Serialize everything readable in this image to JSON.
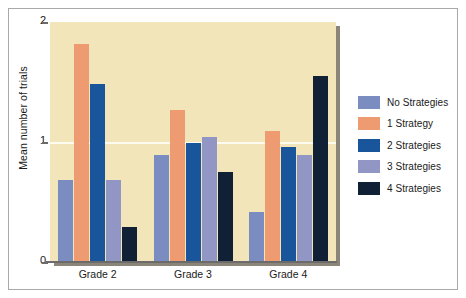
{
  "chart_data": {
    "type": "bar",
    "title": "",
    "xlabel": "",
    "ylabel": "Mean number of trials",
    "categories": [
      "Grade 2",
      "Grade 3",
      "Grade 4"
    ],
    "ylim": [
      0,
      2
    ],
    "yticks": [
      "0",
      "1",
      "2"
    ],
    "ytick_values": [
      0,
      1,
      2
    ],
    "grid": "horizontal gridline at y=1",
    "legend_position": "right",
    "plot_background": "#f2e5ba",
    "series": [
      {
        "name": "No Strategies",
        "color": "#7b8cc0",
        "values": [
          0.68,
          0.89,
          0.42
        ]
      },
      {
        "name": "1 Strategy",
        "color": "#ef9b72",
        "values": [
          1.82,
          1.27,
          1.09
        ]
      },
      {
        "name": "2 Strategies",
        "color": "#19559b",
        "values": [
          1.48,
          0.99,
          0.96
        ]
      },
      {
        "name": "3 Strategies",
        "color": "#9296c4",
        "values": [
          0.68,
          1.04,
          0.89
        ]
      },
      {
        "name": "4 Strategies",
        "color": "#102136",
        "values": [
          0.29,
          0.75,
          1.55
        ]
      }
    ]
  }
}
